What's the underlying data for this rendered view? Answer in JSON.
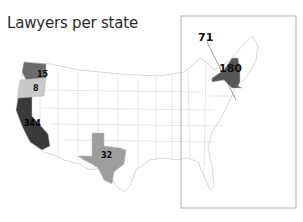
{
  "title": "Lawyers per state",
  "colors": {
    "background": "#ffffff",
    "state_border": "#bdbdbd",
    "inset_border": "#9a9a9a",
    "scale": {
      "lightest": "#c9c9c9",
      "light": "#9d9d9d",
      "mid": "#6b6b6b",
      "dark": "#565656",
      "darkest": "#3a3a3a"
    }
  },
  "states": [
    {
      "name": "Washington",
      "value": "15",
      "fill": "#6b6b6b"
    },
    {
      "name": "Oregon",
      "value": "8",
      "fill": "#c9c9c9"
    },
    {
      "name": "California",
      "value": "344",
      "fill": "#3a3a3a"
    },
    {
      "name": "Texas",
      "value": "32",
      "fill": "#9d9d9d"
    },
    {
      "name": "New York",
      "value": "180",
      "fill": "#565656"
    },
    {
      "name": "Mid-Atlantic (leader line)",
      "value": "71",
      "fill": "#ffffff"
    }
  ],
  "inset": {
    "label": "Northeast / East Coast detail box"
  }
}
